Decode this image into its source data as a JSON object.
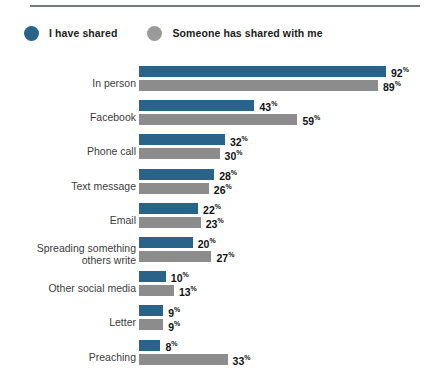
{
  "legend": {
    "items": [
      {
        "label": "I have shared",
        "color": "#2a6389",
        "swatch": "circle-marker-blue"
      },
      {
        "label": "Someone has shared with me",
        "color": "#8c8c8c",
        "swatch": "circle-marker-gray"
      }
    ]
  },
  "chart_data": {
    "type": "bar",
    "orientation": "horizontal",
    "title": "",
    "subtitle": "",
    "xlabel": "",
    "ylabel": "",
    "xlim": [
      0,
      100
    ],
    "grid": false,
    "legend_position": "top-left",
    "value_suffix": "%",
    "categories": [
      "In person",
      "Facebook",
      "Phone call",
      "Text message",
      "Email",
      "Spreading something\nothers write",
      "Other social media",
      "Letter",
      "Preaching"
    ],
    "series": [
      {
        "name": "I have shared",
        "color": "#2a6389",
        "values": [
          92,
          43,
          32,
          28,
          22,
          20,
          10,
          9,
          8
        ],
        "labels": [
          "92",
          "43",
          "32",
          "28",
          "22",
          "20",
          "10",
          "9",
          "8"
        ]
      },
      {
        "name": "Someone has shared with me",
        "color": "#8c8c8c",
        "values": [
          89,
          59,
          30,
          26,
          23,
          27,
          13,
          9,
          33
        ],
        "labels": [
          "89",
          "59",
          "30",
          "26",
          "23",
          "27",
          "13",
          "9",
          "33"
        ]
      }
    ]
  }
}
